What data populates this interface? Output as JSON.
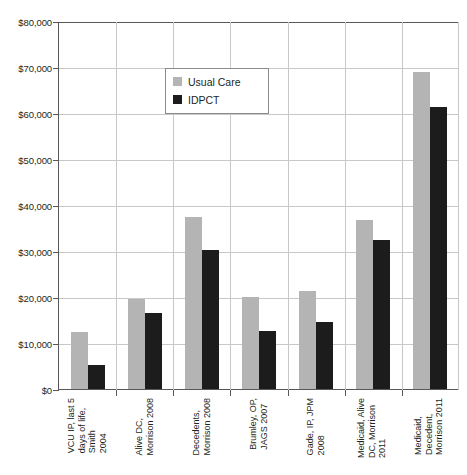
{
  "chart_data": {
    "type": "bar",
    "title": "",
    "xlabel": "",
    "ylabel": "",
    "ylim": [
      0,
      80000
    ],
    "ytick_labels": [
      "$80,000",
      "$70,000",
      "$60,000",
      "$50,000",
      "$40,000",
      "$30,000",
      "$20,000",
      "$10,000",
      "$0"
    ],
    "ytick_values": [
      80000,
      70000,
      60000,
      50000,
      40000,
      30000,
      20000,
      10000,
      0
    ],
    "grid": true,
    "legend_position": "upper-left-inside",
    "categories": [
      "VCU IP, last 5 days of life, Smith 2004",
      "Alive DC, Morrison 2008",
      "Decedents, Morrison 2008",
      "Brumley, OP, JAGS 2007",
      "Gade, IP, JPM 2008",
      "Medicaid, Alive DC, Morrison 2011",
      "Medicaid, Decedent, Morrison 2011"
    ],
    "category_lines": [
      [
        "VCU IP, last 5",
        "days of life,",
        "Smith",
        "2004"
      ],
      [
        "Alive DC,",
        "Morrison 2008"
      ],
      [
        "Decedents,",
        "Morrison 2008"
      ],
      [
        "Brumley, OP,",
        "JAGS 2007"
      ],
      [
        "Gade, IP, JPM",
        "2008"
      ],
      [
        "Medicaid, Alive",
        "DC, Morrison",
        "2011"
      ],
      [
        "Medicaid,",
        "Decedent,",
        "Morrison 2011"
      ]
    ],
    "series": [
      {
        "name": "Usual Care",
        "color": "#b4b4b4",
        "values": [
          12400,
          19500,
          37400,
          20100,
          21200,
          36800,
          69000
        ]
      },
      {
        "name": "IDPCT",
        "color": "#1c1c1c",
        "values": [
          5300,
          16600,
          30200,
          12700,
          14500,
          32500,
          61200
        ]
      }
    ]
  },
  "legend": {
    "items": [
      {
        "label": "Usual Care",
        "swatch": "usual"
      },
      {
        "label": "IDPCT",
        "swatch": "idpct"
      }
    ]
  }
}
